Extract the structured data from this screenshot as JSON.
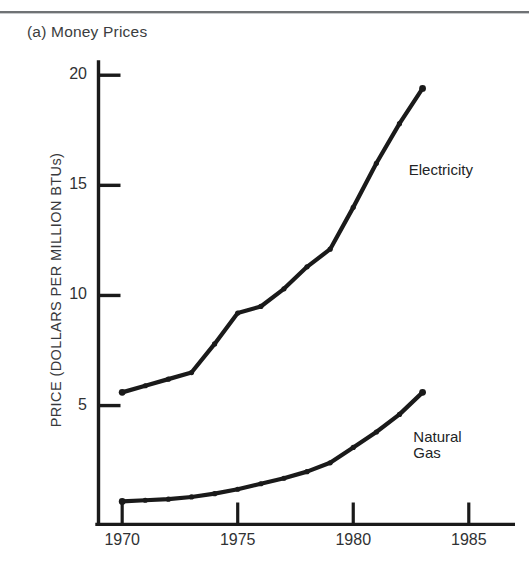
{
  "figure": {
    "panel_label": "(a)  Money Prices",
    "background_color": "#ffffff",
    "rule_color": "#6f7275",
    "ink_color": "#1a1a1a"
  },
  "chart_data": {
    "type": "line",
    "title": "(a)  Money Prices",
    "xlabel": "",
    "ylabel": "PRICE (DOLLARS PER MILLION BTUs)",
    "ylabel_rendered": "PRICE (DOLLARS PER MILLION BTUs)",
    "xlim": [
      1969.3,
      1987.0
    ],
    "ylim": [
      -0.4,
      20.6
    ],
    "grid": false,
    "legend_position": "inline-annotations",
    "y_ticks": [
      5,
      10,
      15,
      20
    ],
    "y_tick_labels": [
      "5",
      "10",
      "15",
      "20"
    ],
    "x_ticks": [
      1970,
      1975,
      1980,
      1985
    ],
    "x_tick_labels": [
      "1970",
      "1975",
      "1980",
      "1985"
    ],
    "x": [
      1970,
      1971,
      1972,
      1973,
      1974,
      1975,
      1976,
      1977,
      1978,
      1979,
      1980,
      1981,
      1982,
      1983
    ],
    "series": [
      {
        "name": "Electricity",
        "label": "Electricity",
        "color": "#1a1a1a",
        "values": [
          5.6,
          5.9,
          6.2,
          6.5,
          7.8,
          9.2,
          9.5,
          10.3,
          11.3,
          12.1,
          14.0,
          16.0,
          17.8,
          19.4
        ]
      },
      {
        "name": "Natural Gas",
        "label": "Natural\nGas",
        "label_line1": "Natural",
        "label_line2": "Gas",
        "color": "#1a1a1a",
        "values": [
          0.65,
          0.7,
          0.75,
          0.85,
          1.0,
          1.2,
          1.45,
          1.7,
          2.0,
          2.4,
          3.1,
          3.8,
          4.6,
          5.6
        ]
      }
    ],
    "annotations": [
      {
        "text": "Electricity",
        "x": 1982.4,
        "y": 15.6
      },
      {
        "text": "Natural Gas",
        "x": 1982.6,
        "y": 3.5
      }
    ]
  }
}
